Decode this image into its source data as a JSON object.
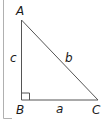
{
  "diagram": {
    "type": "right-triangle",
    "vertices": {
      "A": {
        "label": "A"
      },
      "B": {
        "label": "B"
      },
      "C": {
        "label": "C"
      }
    },
    "sides": {
      "a": {
        "label": "a"
      },
      "b": {
        "label": "b"
      },
      "c": {
        "label": "c"
      }
    },
    "right_angle_at": "B",
    "colors": {
      "stroke": "#555555",
      "frame": "#b0b0b0",
      "text": "#1a1a1a"
    }
  }
}
